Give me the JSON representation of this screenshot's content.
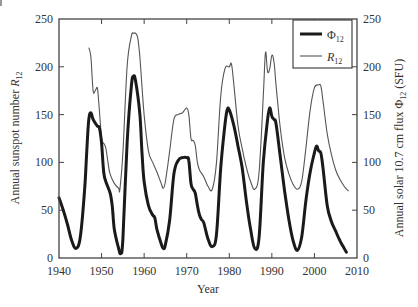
{
  "chart_data": {
    "type": "line",
    "title": "",
    "xlabel": "Year",
    "ylabel_left": "Annual sunspot number R12",
    "ylabel_right": "Annual solar 10.7 cm flux Φ12 (SFU)",
    "xlim": [
      1940,
      2010
    ],
    "ylim_left": [
      0,
      250
    ],
    "ylim_right": [
      0,
      250
    ],
    "x_ticks": [
      1940,
      1950,
      1960,
      1970,
      1980,
      1990,
      2000,
      2010
    ],
    "y_ticks_left": [
      0,
      50,
      100,
      150,
      200,
      250
    ],
    "y_ticks_right": [
      0,
      50,
      100,
      150,
      200,
      250
    ],
    "grid": false,
    "legend_position": "upper right",
    "series": [
      {
        "name": "Φ12",
        "style": "thick",
        "color": "#1a1a1a",
        "x": [
          1940,
          1941,
          1942,
          1943,
          1944,
          1945,
          1946,
          1946.5,
          1947,
          1947.5,
          1948,
          1949,
          1949.5,
          1950,
          1950.5,
          1951,
          1952,
          1952.5,
          1953,
          1954,
          1954.5,
          1955,
          1956,
          1957,
          1957.5,
          1958,
          1959,
          1959.5,
          1960,
          1961,
          1962,
          1962.5,
          1963,
          1964,
          1964.5,
          1965,
          1966,
          1967,
          1968,
          1969,
          1970,
          1970.5,
          1971,
          1971.5,
          1972,
          1972.5,
          1973,
          1973.5,
          1974,
          1975,
          1976,
          1977,
          1978,
          1979,
          1979.5,
          1980,
          1981,
          1982,
          1983,
          1984,
          1985,
          1986,
          1987,
          1988,
          1989,
          1989.5,
          1990,
          1990.5,
          1991,
          1992,
          1993,
          1994,
          1995,
          1996,
          1997,
          1998,
          1999,
          2000,
          2000.5,
          2001,
          2001.5,
          2002,
          2003,
          2004,
          2005,
          2006,
          2007,
          2007.5
        ],
        "values": [
          63,
          50,
          35,
          18,
          10,
          22,
          70,
          110,
          145,
          152,
          145,
          138,
          136,
          120,
          90,
          80,
          68,
          55,
          30,
          10,
          5,
          20,
          120,
          180,
          190,
          185,
          150,
          110,
          80,
          55,
          45,
          42,
          30,
          15,
          10,
          14,
          40,
          88,
          102,
          105,
          105,
          102,
          78,
          72,
          68,
          55,
          45,
          40,
          37,
          20,
          12,
          25,
          95,
          140,
          155,
          155,
          140,
          118,
          95,
          60,
          30,
          10,
          22,
          100,
          145,
          157,
          148,
          145,
          140,
          105,
          70,
          40,
          18,
          8,
          22,
          60,
          90,
          110,
          117,
          112,
          110,
          95,
          55,
          38,
          28,
          18,
          10,
          6
        ]
      },
      {
        "name": "R12",
        "style": "thin",
        "color": "#555555",
        "x": [
          1947,
          1947.5,
          1948,
          1948.5,
          1949,
          1949.3,
          1950,
          1950.5,
          1951,
          1951.5,
          1952,
          1953,
          1954,
          1954.3,
          1955,
          1956,
          1957,
          1957.5,
          1958,
          1958.5,
          1959,
          1960,
          1961,
          1962,
          1963,
          1964,
          1964.5,
          1965,
          1966,
          1967,
          1968,
          1969,
          1970,
          1970.5,
          1971,
          1971.5,
          1972,
          1972.5,
          1973,
          1974,
          1975,
          1976,
          1977,
          1978,
          1979,
          1980,
          1980.5,
          1981,
          1982,
          1983,
          1984,
          1985,
          1986,
          1987,
          1988,
          1988.5,
          1989,
          1989.5,
          1990,
          1990.5,
          1991,
          1992,
          1993,
          1994,
          1995,
          1996,
          1997,
          1998,
          1999,
          2000,
          2001,
          2001.5,
          2002,
          2003,
          2004,
          2005,
          2006,
          2007,
          2008
        ],
        "values": [
          220,
          210,
          175,
          175,
          178,
          165,
          125,
          120,
          115,
          100,
          88,
          78,
          73,
          72,
          110,
          200,
          232,
          235,
          235,
          230,
          210,
          150,
          112,
          100,
          90,
          78,
          73,
          80,
          112,
          145,
          150,
          152,
          157,
          150,
          125,
          123,
          118,
          100,
          92,
          85,
          75,
          72,
          100,
          170,
          198,
          200,
          203,
          185,
          140,
          115,
          95,
          80,
          72,
          90,
          170,
          215,
          195,
          198,
          212,
          205,
          180,
          135,
          105,
          88,
          77,
          72,
          80,
          115,
          155,
          178,
          181,
          180,
          165,
          130,
          108,
          92,
          82,
          75,
          70
        ]
      }
    ]
  },
  "legend": {
    "items": [
      {
        "label": "Φ",
        "sub": "12",
        "style": "thick"
      },
      {
        "label": "R",
        "sub": "12",
        "style": "thin"
      }
    ]
  },
  "axes": {
    "xlabel": "Year",
    "left_label_main": "Annual sunspot number ",
    "left_label_var": "R",
    "left_label_sub": "12",
    "right_label_main": "Annual solar 10.7 cm flux Φ",
    "right_label_sub": "12",
    "right_label_unit": " (SFU)"
  },
  "colors": {
    "phi_line": "#1a1a1a",
    "r_line": "#555555",
    "axes": "#444444"
  }
}
